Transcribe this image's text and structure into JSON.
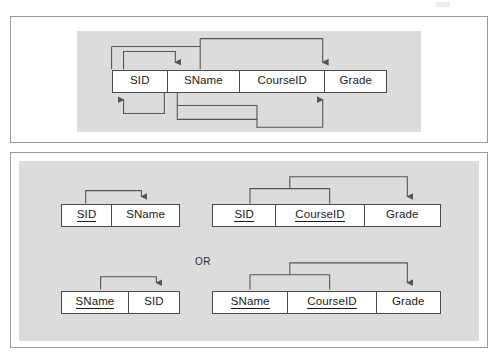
{
  "figure": {
    "type": "database-normalization-diagram",
    "or_label": "OR"
  },
  "panel_top": {
    "name": "unnormalized-relation-with-functional-dependencies",
    "relation": {
      "attributes": [
        {
          "label": "SID",
          "key": false
        },
        {
          "label": "SName",
          "key": false
        },
        {
          "label": "CourseID",
          "key": false
        },
        {
          "label": "Grade",
          "key": false
        }
      ]
    },
    "dependencies": [
      {
        "from": [
          "SID"
        ],
        "to": "SName",
        "side": "above"
      },
      {
        "from": [
          "SID",
          "CourseID"
        ],
        "to": "Grade",
        "side": "above"
      },
      {
        "from": [
          "SName"
        ],
        "to": "SID",
        "side": "below"
      },
      {
        "from": [
          "SName",
          "CourseID"
        ],
        "to": "Grade",
        "side": "below"
      }
    ]
  },
  "panel_bottom": {
    "name": "decomposed-relations",
    "option_a": {
      "relations": [
        {
          "name": "student-relation-sid",
          "attributes": [
            {
              "label": "SID",
              "key": true
            },
            {
              "label": "SName",
              "key": false
            }
          ],
          "dependency": {
            "from": [
              "SID"
            ],
            "to": "SName"
          }
        },
        {
          "name": "enrollment-relation-sid",
          "attributes": [
            {
              "label": "SID",
              "key": true
            },
            {
              "label": "CourseID",
              "key": true
            },
            {
              "label": "Grade",
              "key": false
            }
          ],
          "dependency": {
            "from": [
              "SID",
              "CourseID"
            ],
            "to": "Grade"
          }
        }
      ]
    },
    "option_b": {
      "relations": [
        {
          "name": "student-relation-sname",
          "attributes": [
            {
              "label": "SName",
              "key": true
            },
            {
              "label": "SID",
              "key": false
            }
          ],
          "dependency": {
            "from": [
              "SName"
            ],
            "to": "SID"
          }
        },
        {
          "name": "enrollment-relation-sname",
          "attributes": [
            {
              "label": "SName",
              "key": true
            },
            {
              "label": "CourseID",
              "key": true
            },
            {
              "label": "Grade",
              "key": false
            }
          ],
          "dependency": {
            "from": [
              "SName",
              "CourseID"
            ],
            "to": "Grade"
          }
        }
      ]
    }
  },
  "colors": {
    "panel_background": "#ffffff",
    "panel_border": "#9a9a9a",
    "shaded_area": "#dcdcdc",
    "box_border": "#4a4a4a",
    "text": "#1a1a1a",
    "wire": "#555555"
  }
}
